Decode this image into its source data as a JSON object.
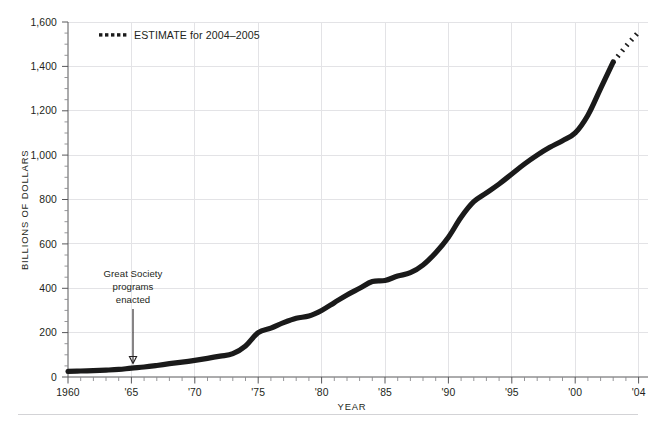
{
  "figure": {
    "top_caption": "",
    "background_color": "#ffffff",
    "line_color": "#1a1a1a",
    "grid_color": "#e3e3e6",
    "axis_color": "#58585b"
  },
  "legend": {
    "position": "top-left-inside",
    "marker": "dotted-line-swatch",
    "label": "ESTIMATE for 2004–2005"
  },
  "annotation": {
    "line1": "Great Society",
    "line2": "programs",
    "line3": "enacted",
    "points_to_year": 1965,
    "arrow": "down-arrow-icon"
  },
  "chart_data": {
    "type": "line",
    "title": "",
    "subtitle": "",
    "xlabel": "YEAR",
    "ylabel": "BILLIONS OF DOLLARS",
    "xlim": [
      1960,
      2005.6
    ],
    "ylim": [
      0,
      1600
    ],
    "ytick_values": [
      0,
      200,
      400,
      600,
      800,
      1000,
      1200,
      1400,
      1600
    ],
    "ytick_labels": [
      "0",
      "200",
      "400",
      "600",
      "800",
      "1,000",
      "1,200",
      "1,400",
      "1,600"
    ],
    "xtick_values": [
      1960,
      1965,
      1970,
      1975,
      1980,
      1985,
      1990,
      1995,
      2000,
      2004
    ],
    "xtick_labels": [
      "1960",
      "'65",
      "'70",
      "'75",
      "'80",
      "'85",
      "'90",
      "'95",
      "'00",
      "'04"
    ],
    "x_minor_interval": 1,
    "y_minor_interval": 50,
    "grid": "both",
    "series": [
      {
        "name": "Actual",
        "style": "solid",
        "x": [
          1960,
          1961,
          1962,
          1963,
          1964,
          1965,
          1966,
          1967,
          1968,
          1969,
          1970,
          1971,
          1972,
          1973,
          1974,
          1975,
          1976,
          1977,
          1978,
          1979,
          1980,
          1981,
          1982,
          1983,
          1984,
          1985,
          1986,
          1987,
          1988,
          1989,
          1990,
          1991,
          1992,
          1993,
          1994,
          1995,
          1996,
          1997,
          1998,
          1999,
          2000,
          2001,
          2002,
          2003
        ],
        "values": [
          25,
          27,
          29,
          31,
          34,
          40,
          45,
          52,
          60,
          67,
          75,
          84,
          94,
          105,
          140,
          200,
          220,
          245,
          265,
          275,
          300,
          335,
          370,
          400,
          430,
          435,
          455,
          470,
          505,
          560,
          630,
          720,
          790,
          830,
          870,
          915,
          960,
          1000,
          1035,
          1065,
          1100,
          1180,
          1300,
          1420
        ]
      },
      {
        "name": "ESTIMATE for 2004–2005",
        "style": "dotted",
        "x": [
          2003,
          2004,
          2005
        ],
        "values": [
          1420,
          1490,
          1555
        ]
      }
    ]
  }
}
